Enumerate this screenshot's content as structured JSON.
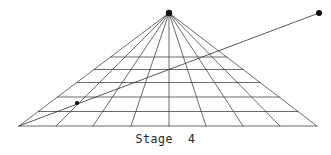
{
  "figure": {
    "caption": "Stage  4",
    "stage_number": "4",
    "title": "Stage 4",
    "line_color": "#3a3a3a",
    "dot_color": "#111111",
    "background_color": "#ffffff",
    "canvas": {
      "width": 331,
      "height": 155
    }
  },
  "chart_data": {
    "type": "diagram",
    "title": "Stage 4",
    "xlabel": "",
    "ylabel": "",
    "grid": true,
    "legend_position": "none",
    "vanishing_point": {
      "x": 169,
      "y": 13,
      "label": "apex"
    },
    "base_left": {
      "x": 19,
      "y": 126
    },
    "base_right": {
      "x": 317,
      "y": 126
    },
    "radial_line_count": 9,
    "radial_base_x": [
      19,
      56,
      93,
      131,
      169,
      206,
      243,
      280,
      317
    ],
    "horizontal_lines_y": [
      57,
      69.5,
      82.5,
      97,
      111.5,
      126
    ],
    "horizontal_line_count": 6,
    "construction_ray": {
      "from": {
        "x": 19,
        "y": 126
      },
      "through": {
        "x": 77,
        "y": 103
      },
      "to": {
        "x": 319,
        "y": 13
      }
    },
    "marked_points": [
      {
        "name": "vanishing-point-dot",
        "x": 169,
        "y": 13,
        "radius": 3.2
      },
      {
        "name": "grid-intersection-dot",
        "x": 77,
        "y": 103,
        "radius": 2.1
      },
      {
        "name": "external-point-dot",
        "x": 319,
        "y": 13,
        "radius": 3.0
      }
    ]
  }
}
